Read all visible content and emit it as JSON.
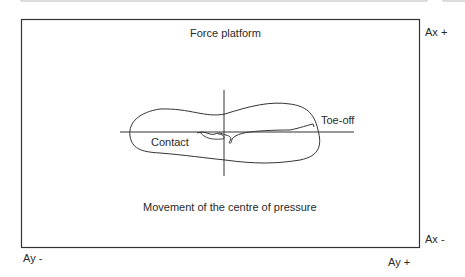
{
  "diagram": {
    "platform_title": "Force platform",
    "caption": "Movement of the centre of pressure",
    "labels": {
      "contact": "Contact",
      "toe_off": "Toe-off",
      "ax_plus": "Ax +",
      "ax_minus": "Ax -",
      "ay_minus": "Ay -",
      "ay_plus": "Ay +"
    },
    "colors": {
      "line": "#333333",
      "background": "#ffffff"
    }
  }
}
